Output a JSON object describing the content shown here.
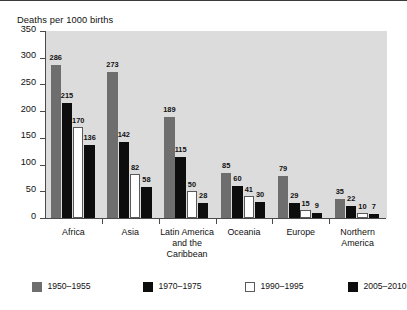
{
  "chart_data": {
    "type": "bar",
    "title": "",
    "subtitle": "",
    "ylabel": "Deaths per 1000 births",
    "xlabel": "",
    "ylim": [
      0,
      350
    ],
    "yticks": [
      0,
      50,
      100,
      150,
      200,
      250,
      300,
      350
    ],
    "ytick_labels": [
      "0",
      "50",
      "100",
      "150",
      "200",
      "250",
      "300",
      "350"
    ],
    "grid": false,
    "legend_position": "bottom",
    "categories": [
      "Africa",
      "Asia",
      "Latin America and the Caribbean",
      "Oceania",
      "Europe",
      "Northern America"
    ],
    "category_lines": [
      [
        "Africa"
      ],
      [
        "Asia"
      ],
      [
        "Latin America",
        "and the",
        "Caribbean"
      ],
      [
        "Oceania"
      ],
      [
        "Europe"
      ],
      [
        "Northern",
        "America"
      ]
    ],
    "series": [
      {
        "name": "1950–1955",
        "color": "#6e6e6e",
        "values": [
          286,
          273,
          189,
          85,
          79,
          35
        ]
      },
      {
        "name": "1970–1975",
        "color": "#0d0d0d",
        "values": [
          215,
          142,
          115,
          60,
          29,
          22
        ]
      },
      {
        "name": "1990–1995",
        "color": "#ffffff",
        "values": [
          170,
          82,
          50,
          41,
          15,
          10
        ]
      },
      {
        "name": "2005–2010",
        "color": "#0d0d0d",
        "values": [
          136,
          58,
          28,
          30,
          9,
          7
        ]
      }
    ]
  },
  "colors": {
    "plot_background": "#dcdcdc",
    "page_background": "#ffffff",
    "axis": "#4a4a4a",
    "text": "#111111"
  }
}
